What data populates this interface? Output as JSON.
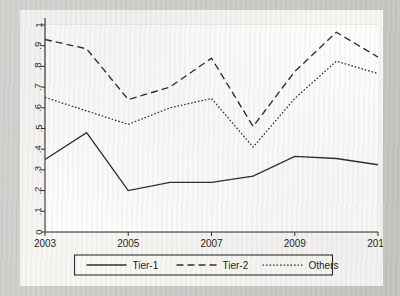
{
  "chart_data": {
    "type": "line",
    "title": "",
    "subtitle": "",
    "xlabel": "",
    "ylabel": "",
    "x": [
      2003,
      2004,
      2005,
      2006,
      2007,
      2008,
      2009,
      2010,
      2011
    ],
    "xlim": [
      2003,
      2011
    ],
    "ylim": [
      0,
      1
    ],
    "xtick_labels": [
      "2003",
      "2005",
      "2007",
      "2009",
      "2011"
    ],
    "xticks": [
      2003,
      2005,
      2007,
      2009,
      2011
    ],
    "ytick_labels": [
      "0",
      ".1",
      ".2",
      ".3",
      ".4",
      ".5",
      ".6",
      ".7",
      ".8",
      ".9",
      "1"
    ],
    "yticks": [
      0,
      0.1,
      0.2,
      0.3,
      0.4,
      0.5,
      0.6,
      0.7,
      0.8,
      0.9,
      1
    ],
    "grid": "horizontal",
    "legend_position": "bottom-outside",
    "series": [
      {
        "name": "Tier-1",
        "style": "solid",
        "color": "#2b2b2b",
        "values": [
          0.35,
          0.48,
          0.2,
          0.24,
          0.24,
          0.27,
          0.365,
          0.355,
          0.325
        ]
      },
      {
        "name": "Tier-2",
        "style": "dashed",
        "color": "#2b2b2b",
        "values": [
          0.93,
          0.885,
          0.64,
          0.7,
          0.84,
          0.51,
          0.775,
          0.965,
          0.845
        ]
      },
      {
        "name": "Others",
        "style": "dotted",
        "color": "#2b2b2b",
        "values": [
          0.65,
          0.585,
          0.52,
          0.6,
          0.645,
          0.41,
          0.645,
          0.825,
          0.765
        ]
      }
    ]
  },
  "legend": {
    "items": [
      {
        "label": "Tier-1",
        "style": "solid"
      },
      {
        "label": "Tier-2",
        "style": "dashed"
      },
      {
        "label": "Others",
        "style": "dotted"
      }
    ]
  }
}
